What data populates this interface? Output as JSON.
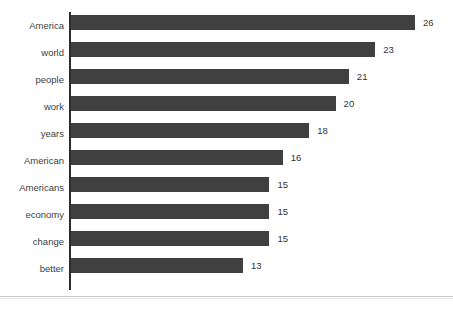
{
  "chart_data": {
    "type": "bar",
    "orientation": "horizontal",
    "title": "",
    "subtitle": "",
    "xlabel": "",
    "ylabel": "",
    "grid": false,
    "legend": false,
    "legend_position": "none",
    "xlim": [
      0,
      26
    ],
    "axis_line": "vertical-left",
    "value_labels": true,
    "bar_color": "#404040",
    "label_color": "#404040",
    "background": "#ffffff",
    "categories": [
      "America",
      "world",
      "people",
      "work",
      "years",
      "American",
      "Americans",
      "economy",
      "change",
      "better"
    ],
    "values": [
      26,
      23,
      21,
      20,
      18,
      16,
      15,
      15,
      15,
      13
    ],
    "value_labels_text": [
      "26",
      "23",
      "21",
      "20",
      "18",
      "16",
      "15",
      "15",
      "15",
      "13"
    ],
    "bars": [
      {
        "category": "America",
        "value": 26,
        "label": "26"
      },
      {
        "category": "world",
        "value": 23,
        "label": "23"
      },
      {
        "category": "people",
        "value": 21,
        "label": "21"
      },
      {
        "category": "work",
        "value": 20,
        "label": "20"
      },
      {
        "category": "years",
        "value": 18,
        "label": "18"
      },
      {
        "category": "American",
        "value": 16,
        "label": "16"
      },
      {
        "category": "Americans",
        "value": 15,
        "label": "15"
      },
      {
        "category": "economy",
        "value": 15,
        "label": "15"
      },
      {
        "category": "change",
        "value": 15,
        "label": "15"
      },
      {
        "category": "better",
        "value": 13,
        "label": "13"
      }
    ]
  }
}
